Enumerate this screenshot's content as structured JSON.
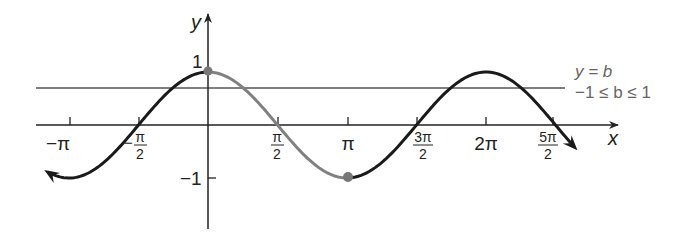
{
  "chart_data": {
    "type": "line",
    "title": "",
    "function": "y = cos x",
    "xlabel": "x",
    "ylabel": "y",
    "xlim": [
      -3.6,
      8.6
    ],
    "ylim": [
      -1.5,
      1.45
    ],
    "grid": false,
    "x_ticks": [
      {
        "value": -3.14159,
        "label_main": "−π",
        "label_num": "",
        "label_den": ""
      },
      {
        "value": -1.5708,
        "label_main": "−",
        "label_num": "π",
        "label_den": "2"
      },
      {
        "value": 1.5708,
        "label_main": "",
        "label_num": "π",
        "label_den": "2"
      },
      {
        "value": 3.14159,
        "label_main": "π",
        "label_num": "",
        "label_den": ""
      },
      {
        "value": 4.71239,
        "label_main": "",
        "label_num": "3π",
        "label_den": "2"
      },
      {
        "value": 6.28319,
        "label_main": "2π",
        "label_num": "",
        "label_den": ""
      },
      {
        "value": 7.85398,
        "label_main": "",
        "label_num": "5π",
        "label_den": "2"
      }
    ],
    "y_ticks": [
      {
        "value": 1,
        "label": "1"
      },
      {
        "value": -1,
        "label": "−1"
      }
    ],
    "series": [
      {
        "name": "y = cos x (left)",
        "x_start": -3.6,
        "x_end": 0,
        "color": "#1a1a1a"
      },
      {
        "name": "y = cos x on [0, π] (highlighted)",
        "x_start": 0,
        "x_end": 3.14159,
        "color": "#808080"
      },
      {
        "name": "y = cos x (right)",
        "x_start": 3.14159,
        "x_end": 8.4,
        "color": "#1a1a1a"
      }
    ],
    "points": [
      {
        "x": 0,
        "y": 1,
        "label": "(0, 1)"
      },
      {
        "x": 3.14159,
        "y": -1,
        "label": "(π, −1)"
      }
    ],
    "reference_line": {
      "y": 0.68,
      "label_line1": "y = b",
      "label_line2": "−1 ≤ b ≤ 1"
    },
    "legend": {
      "position": "none"
    }
  },
  "labels": {
    "x_axis": "x",
    "y_axis": "y",
    "y_one": "1",
    "y_neg_one": "−1",
    "ref_line1": "y = b",
    "ref_line2": "−1 ≤ b ≤ 1",
    "neg_pi": "−π",
    "neg_sign": "−",
    "pi": "π",
    "two_pi": "2π",
    "half_num": "π",
    "half_den": "2",
    "three_half_num": "3π",
    "three_half_den": "2",
    "five_half_num": "5π",
    "five_half_den": "2"
  },
  "colors": {
    "curve": "#1a1a1a",
    "highlight": "#808080",
    "axis": "#222222",
    "ref_line": "#555555",
    "point": "#777777"
  }
}
